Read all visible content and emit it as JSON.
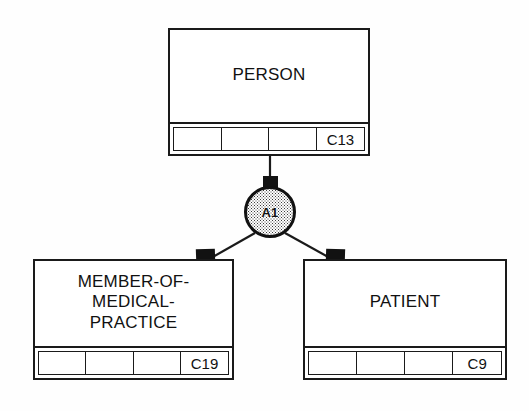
{
  "diagram": {
    "background_color": "#ffffff",
    "line_color": "#1a1a1a",
    "fill_color": "#ffffff",
    "node_fill_pattern": "stipple-dots"
  },
  "entities": [
    {
      "id": "person",
      "name": "PERSON",
      "label": "PERSON",
      "code": "C13",
      "attribute_cells": [
        "",
        "",
        "",
        "C13"
      ],
      "position": {
        "x": 168,
        "y": 28,
        "width": 202,
        "height": 128
      }
    },
    {
      "id": "member-of-medical-practice",
      "name": "MEMBER-OF-MEDICAL-PRACTICE",
      "label": "MEMBER-OF-\nMEDICAL-\nPRACTICE",
      "code": "C19",
      "attribute_cells": [
        "",
        "",
        "",
        "C19"
      ],
      "position": {
        "x": 33,
        "y": 259,
        "width": 201,
        "height": 121
      }
    },
    {
      "id": "patient",
      "name": "PATIENT",
      "label": "PATIENT",
      "code": "C9",
      "attribute_cells": [
        "",
        "",
        "",
        "C9"
      ],
      "position": {
        "x": 303,
        "y": 259,
        "width": 204,
        "height": 121
      }
    }
  ],
  "relationship_nodes": [
    {
      "id": "a1",
      "label": "A1",
      "shape": "circle",
      "position": {
        "x": 244,
        "y": 186,
        "diameter": 52
      }
    }
  ],
  "connectors": [
    {
      "id": "person-to-a1",
      "from": "person",
      "to": "a1",
      "marker": "filled-rect"
    },
    {
      "id": "a1-to-member",
      "from": "a1",
      "to": "member-of-medical-practice",
      "marker": "filled-rect"
    },
    {
      "id": "a1-to-patient",
      "from": "a1",
      "to": "patient",
      "marker": "filled-rect"
    }
  ]
}
